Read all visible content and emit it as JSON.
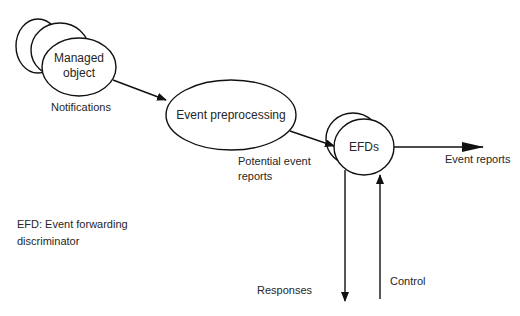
{
  "diagram": {
    "nodes": {
      "managed_object": {
        "label_line1": "Managed",
        "label_line2": "object"
      },
      "event_preprocessing": {
        "label": "Event preprocessing"
      },
      "efds": {
        "label": "EFDs"
      }
    },
    "edges": {
      "notifications": {
        "label": "Notifications"
      },
      "potential_event_reports": {
        "label_line1": "Potential event",
        "label_line2": "reports"
      },
      "event_reports": {
        "label": "Event reports"
      },
      "responses": {
        "label": "Responses"
      },
      "control": {
        "label": "Control"
      }
    },
    "legend": {
      "line1": "EFD: Event forwarding",
      "line2": "discriminator"
    },
    "colors": {
      "stroke": "#111111",
      "text": "#262626",
      "background": "#ffffff"
    }
  }
}
